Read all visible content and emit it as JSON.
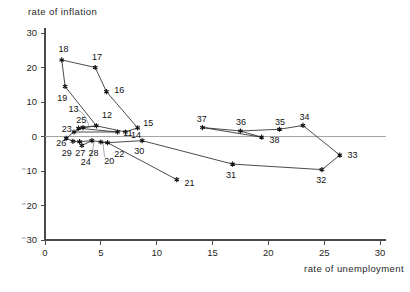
{
  "chart_data": {
    "type": "scatter",
    "title": "",
    "xlabel": "rate of unemployment",
    "ylabel": "rate of inflation",
    "xlim": [
      0,
      30
    ],
    "ylim": [
      -30,
      30
    ],
    "xticks": [
      0,
      5,
      10,
      15,
      20,
      25,
      30
    ],
    "xtick_labels": [
      "0",
      "5",
      "10",
      "15",
      "20",
      "25",
      "30"
    ],
    "yticks": [
      -30,
      -20,
      -10,
      0,
      10,
      20,
      30
    ],
    "ytick_labels": [
      "⁻30",
      "⁻20",
      "⁻10",
      "0",
      "10",
      "20",
      "30"
    ],
    "grid": false,
    "legend": "none",
    "zero_rule": true,
    "connected": true,
    "points": [
      {
        "label": "11",
        "x": 6.5,
        "y": 1.3,
        "lx": 7.0,
        "ly": 1.0,
        "anchor": "start"
      },
      {
        "label": "12",
        "x": 4.6,
        "y": 3.1,
        "lx": 5.1,
        "ly": 6.2,
        "anchor": "start"
      },
      {
        "label": "13",
        "x": 3.0,
        "y": 2.4,
        "lx": 2.1,
        "ly": 8.0,
        "anchor": "start"
      },
      {
        "label": "14",
        "x": 7.2,
        "y": 1.3,
        "lx": 7.7,
        "ly": 0.6,
        "anchor": "start"
      },
      {
        "label": "15",
        "x": 8.3,
        "y": 2.5,
        "lx": 8.8,
        "ly": 3.9,
        "anchor": "start"
      },
      {
        "label": "16",
        "x": 5.5,
        "y": 13.0,
        "lx": 6.2,
        "ly": 13.4,
        "anchor": "start"
      },
      {
        "label": "17",
        "x": 4.5,
        "y": 20.0,
        "lx": 4.2,
        "ly": 23.2,
        "anchor": "start"
      },
      {
        "label": "18",
        "x": 1.5,
        "y": 22.2,
        "lx": 1.2,
        "ly": 25.3,
        "anchor": "start"
      },
      {
        "label": "19",
        "x": 1.8,
        "y": 14.5,
        "lx": 1.1,
        "ly": 11.2,
        "anchor": "start"
      },
      {
        "label": "20",
        "x": 5.0,
        "y": -1.6,
        "lx": 5.3,
        "ly": -6.9,
        "anchor": "start"
      },
      {
        "label": "21",
        "x": 11.8,
        "y": -12.5,
        "lx": 12.5,
        "ly": -13.3,
        "anchor": "start"
      },
      {
        "label": "22",
        "x": 5.6,
        "y": -1.8,
        "lx": 6.2,
        "ly": -5.1,
        "anchor": "start"
      },
      {
        "label": "23",
        "x": 2.6,
        "y": 1.3,
        "lx": 1.5,
        "ly": 2.1,
        "anchor": "start"
      },
      {
        "label": "24",
        "x": 3.3,
        "y": -2.6,
        "lx": 3.2,
        "ly": -7.4,
        "anchor": "start"
      },
      {
        "label": "25",
        "x": 3.4,
        "y": 2.6,
        "lx": 2.8,
        "ly": 4.9,
        "anchor": "start"
      },
      {
        "label": "26",
        "x": 1.9,
        "y": -0.5,
        "lx": 1.0,
        "ly": -1.9,
        "anchor": "start"
      },
      {
        "label": "27",
        "x": 3.1,
        "y": -1.5,
        "lx": 2.7,
        "ly": -4.7,
        "anchor": "start"
      },
      {
        "label": "28",
        "x": 4.2,
        "y": -1.2,
        "lx": 3.9,
        "ly": -4.7,
        "anchor": "start"
      },
      {
        "label": "29",
        "x": 2.5,
        "y": -1.4,
        "lx": 1.5,
        "ly": -4.6,
        "anchor": "start"
      },
      {
        "label": "30",
        "x": 8.7,
        "y": -1.2,
        "lx": 8.0,
        "ly": -4.2,
        "anchor": "start"
      },
      {
        "label": "31",
        "x": 16.8,
        "y": -8.0,
        "lx": 16.2,
        "ly": -11.0,
        "anchor": "start"
      },
      {
        "label": "32",
        "x": 24.8,
        "y": -9.6,
        "lx": 24.3,
        "ly": -12.6,
        "anchor": "start"
      },
      {
        "label": "33",
        "x": 26.4,
        "y": -5.4,
        "lx": 27.1,
        "ly": -5.2,
        "anchor": "start"
      },
      {
        "label": "34",
        "x": 23.1,
        "y": 3.2,
        "lx": 22.8,
        "ly": 5.6,
        "anchor": "start"
      },
      {
        "label": "35",
        "x": 21.0,
        "y": 2.1,
        "lx": 20.6,
        "ly": 4.3,
        "anchor": "start"
      },
      {
        "label": "36",
        "x": 17.5,
        "y": 1.6,
        "lx": 17.1,
        "ly": 4.3,
        "anchor": "start"
      },
      {
        "label": "37",
        "x": 14.1,
        "y": 2.6,
        "lx": 13.6,
        "ly": 5.0,
        "anchor": "start"
      },
      {
        "label": "38",
        "x": 19.4,
        "y": -0.2,
        "lx": 20.1,
        "ly": -0.9,
        "anchor": "start"
      }
    ],
    "paths": [
      {
        "name": "segment-18-17-16-15",
        "sequence": [
          "18",
          "17",
          "16",
          "15"
        ]
      },
      {
        "name": "segment-18-19",
        "sequence": [
          "18",
          "19"
        ]
      },
      {
        "name": "segment-19-12",
        "sequence": [
          "19",
          "12"
        ]
      },
      {
        "name": "segment-12-14",
        "sequence": [
          "12",
          "14"
        ]
      },
      {
        "name": "segment-14-15",
        "sequence": [
          "14",
          "15"
        ]
      },
      {
        "name": "segment-13-12",
        "sequence": [
          "13",
          "12"
        ]
      },
      {
        "name": "segment-23-25-12",
        "sequence": [
          "23",
          "25",
          "12"
        ]
      },
      {
        "name": "segment-23-11",
        "sequence": [
          "23",
          "11"
        ]
      },
      {
        "name": "segment-26-23",
        "sequence": [
          "26",
          "23"
        ]
      },
      {
        "name": "segment-26-29-27-28-22",
        "sequence": [
          "26",
          "29",
          "27",
          "28",
          "22"
        ]
      },
      {
        "name": "segment-24-28",
        "sequence": [
          "24",
          "28"
        ]
      },
      {
        "name": "segment-20-22-30",
        "sequence": [
          "20",
          "22",
          "30"
        ]
      },
      {
        "name": "segment-22-21",
        "sequence": [
          "22",
          "21"
        ]
      },
      {
        "name": "segment-30-31-32-33",
        "sequence": [
          "30",
          "31",
          "32",
          "33"
        ]
      },
      {
        "name": "segment-33-34-35-36-37",
        "sequence": [
          "33",
          "34",
          "35",
          "36",
          "37"
        ]
      },
      {
        "name": "segment-37-38",
        "sequence": [
          "37",
          "38"
        ]
      },
      {
        "name": "segment-38-36",
        "sequence": [
          "38",
          "36"
        ]
      },
      {
        "name": "segment-11-13",
        "sequence": [
          "11",
          "13"
        ]
      }
    ],
    "leaders": [
      {
        "name": "leader-13",
        "from": [
          2.9,
          7.6
        ],
        "to": [
          4.0,
          2.7
        ]
      },
      {
        "name": "leader-24",
        "from": [
          3.9,
          -6.6
        ],
        "to": [
          4.4,
          -1.5
        ]
      },
      {
        "name": "leader-20",
        "from": [
          5.4,
          -6.1
        ],
        "to": [
          5.2,
          -1.9
        ]
      }
    ]
  }
}
